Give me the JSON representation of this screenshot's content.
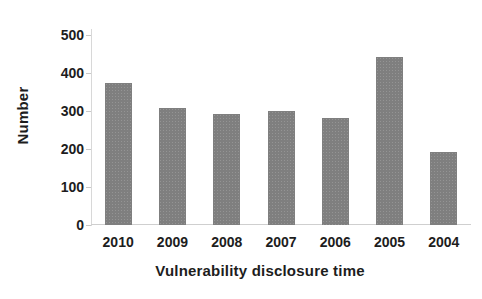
{
  "chart_data": {
    "type": "bar",
    "title": "",
    "subtitle": "",
    "xlabel": "Vulnerability disclosure time",
    "ylabel": "Number",
    "categories": [
      "2010",
      "2009",
      "2008",
      "2007",
      "2006",
      "2005",
      "2004"
    ],
    "values": [
      375,
      308,
      292,
      300,
      282,
      441,
      192
    ],
    "series": [
      {
        "name": "Number",
        "values": [
          375,
          308,
          292,
          300,
          282,
          441,
          192
        ]
      }
    ],
    "ylim": [
      0,
      500
    ],
    "y_ticks": [
      0,
      100,
      200,
      300,
      400,
      500
    ],
    "y_tick_labels": [
      "0",
      "100",
      "200",
      "300",
      "400",
      "500"
    ],
    "grid": false,
    "legend": false,
    "legend_position": "none",
    "bar_color": "#7f7f7f",
    "background_color": "#ffffff",
    "axis_color": "#cfcfcf",
    "text_color": "#1d1d1d",
    "annotations": []
  }
}
